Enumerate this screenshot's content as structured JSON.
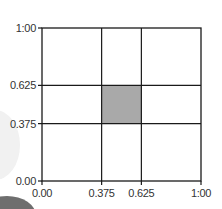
{
  "chart_data": {
    "type": "heatmap",
    "title": "",
    "xlabel": "",
    "ylabel": "",
    "xlim": [
      0,
      1
    ],
    "ylim": [
      0,
      1
    ],
    "grid": true,
    "x_ticks": [
      0,
      0.375,
      0.625,
      1
    ],
    "y_ticks": [
      0,
      0.375,
      0.625,
      1
    ],
    "x_tick_labels": [
      "0.00",
      "0.375",
      "0.625",
      "1:00"
    ],
    "y_tick_labels": [
      "0.00",
      "0.375",
      "0.625",
      "1:00"
    ],
    "grid_lines_x": [
      0.375,
      0.625
    ],
    "grid_lines_y": [
      0.375,
      0.625
    ],
    "shaded_regions": [
      {
        "x0": 0.375,
        "x1": 0.625,
        "y0": 0.375,
        "y1": 0.625,
        "color": "#a9a9a9"
      }
    ],
    "legend": null
  },
  "colors": {
    "line": "#1a1a1a",
    "shade": "#a9a9a9",
    "background": "#ffffff",
    "text": "#333333"
  }
}
